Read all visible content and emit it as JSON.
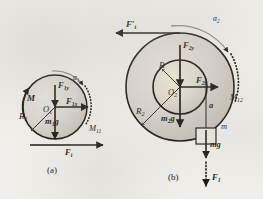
{
  "figure": {
    "title_visible": false,
    "type": "free-body-diagram",
    "background_color": "#f2f0ec",
    "ink_color": "#17150f"
  },
  "panel_a": {
    "caption": "(a)",
    "center_label": "O",
    "center_sub": "1",
    "radius_label": "R",
    "radius_sub": "1",
    "moment_label": "M",
    "moment_sub": "",
    "angular_accel_label": "α",
    "angular_accel_sub": "1",
    "friction_moment_label": "M",
    "friction_moment_sub": "11",
    "force_vertical_label": "F",
    "force_vertical_sub": "1y",
    "force_horizontal_label": "F",
    "force_horizontal_sub": "1x",
    "weight_label": "m",
    "weight_sub": "1",
    "weight_tail": "g",
    "tension_label": "F",
    "tension_sub": "t"
  },
  "panel_b": {
    "caption": "(b)",
    "center_label": "O",
    "center_sub": "2",
    "inner_radius_label": "R",
    "inner_radius_sub": "",
    "outer_radius_label": "R",
    "outer_radius_sub": "2",
    "applied_force_label": "F",
    "applied_force_sub": "t",
    "applied_force_prime": "′",
    "angular_accel_label": "α",
    "angular_accel_sub": "2",
    "friction_moment_label": "M",
    "friction_moment_sub": "12",
    "force_vertical_label": "F",
    "force_vertical_sub": "2y",
    "force_horizontal_label": "F",
    "force_horizontal_sub": "2x",
    "weight_label": "m",
    "weight_sub": "2",
    "weight_tail": "g",
    "accel_label": "a",
    "block_label": "m",
    "block_weight_label": "mg",
    "block_tension_label": "F",
    "block_tension_sub": "1"
  }
}
